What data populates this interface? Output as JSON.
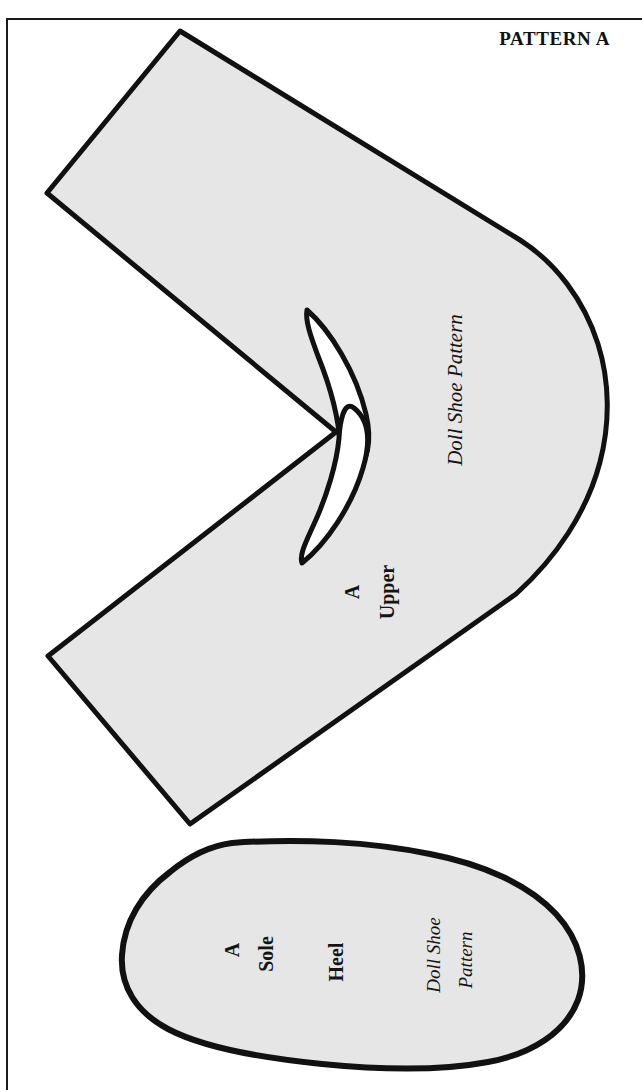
{
  "page": {
    "title": "PATTERN A",
    "background_color": "#ffffff",
    "frame_color": "#1a1a1a"
  },
  "style": {
    "piece_fill": "#e6e6e6",
    "piece_outline": "#111111",
    "cutout_fill": "#ffffff",
    "text_color": "#141414"
  },
  "pieces": [
    {
      "id": "upper",
      "name": "Upper",
      "labels": {
        "size": "A",
        "part": "Upper",
        "credit": "Doll Shoe Pattern"
      }
    },
    {
      "id": "sole",
      "name": "Sole",
      "labels": {
        "size": "A",
        "part": "Sole",
        "heel": "Heel",
        "credit_line1": "Doll Shoe",
        "credit_line2": "Pattern"
      }
    }
  ],
  "icons": {
    "upper_piece": "shoe-upper-pattern-shape",
    "sole_piece": "shoe-sole-pattern-shape",
    "cutout_upper": "crescent-cutout-upper",
    "cutout_lower": "crescent-cutout-lower"
  }
}
